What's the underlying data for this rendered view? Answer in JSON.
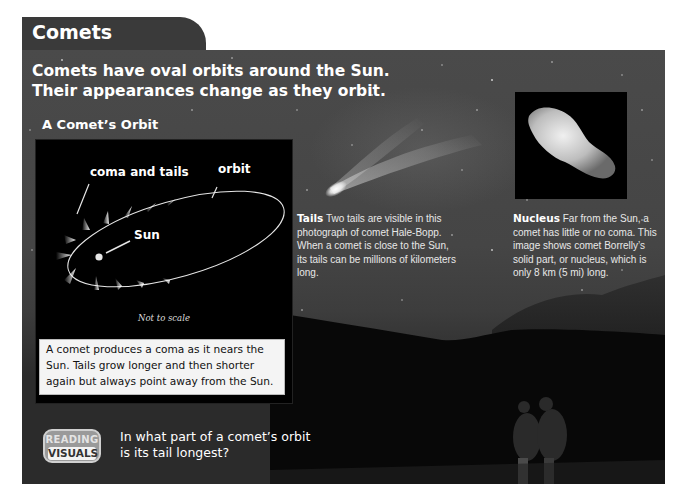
{
  "header": {
    "tab_title": "Comets"
  },
  "intro": {
    "text": "Comets have oval orbits around the Sun. Their appearances change as they orbit."
  },
  "diagram": {
    "heading": "A Comet’s Orbit",
    "labels": {
      "coma_and_tails": "coma and tails",
      "orbit": "orbit",
      "sun": "Sun",
      "not_to_scale": "Not to scale"
    },
    "caption": "A comet produces a coma as it nears the Sun. Tails grow longer and then shorter again but always point away from the Sun."
  },
  "tails_note": {
    "title": "Tails",
    "text": "Two tails are visible in this photograph of comet Hale-Bopp. When a comet is close to the Sun, its tails can be millions of kilometers long."
  },
  "nucleus_note": {
    "title": "Nucleus",
    "text": "Far from the Sun, a comet has little or no coma. This image shows comet Borrelly’s solid part, or nucleus, which is only 8 km (5 mi) long."
  },
  "reading_visuals": {
    "badge_top": "READING",
    "badge_bottom": "VISUALS",
    "question": "In what part of a comet’s orbit is its tail longest?"
  },
  "colors": {
    "tab_bg": "#3a3a3a",
    "panel_bg": "#454545",
    "diagram_bg": "#000000",
    "caption_bg": "#f4f4f4",
    "badge_bg": "#9a9a9a"
  }
}
